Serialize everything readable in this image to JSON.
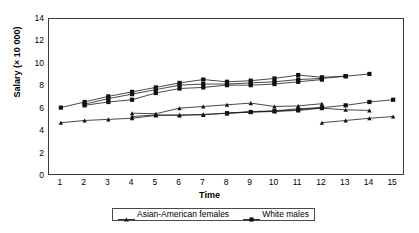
{
  "chart_data": {
    "type": "line",
    "title": "",
    "xlabel": "Time",
    "ylabel": "Salary (× 10 000)",
    "xlim": [
      0.5,
      15.5
    ],
    "ylim": [
      0,
      14
    ],
    "yticks": [
      0,
      2,
      4,
      6,
      8,
      10,
      12,
      14
    ],
    "xticks": [
      1,
      2,
      3,
      4,
      5,
      6,
      7,
      8,
      9,
      10,
      11,
      12,
      13,
      14,
      15
    ],
    "grid": false,
    "legend_position": "below-axes",
    "legend": [
      {
        "label": "Asian-American females",
        "marker": "triangle"
      },
      {
        "label": "White males",
        "marker": "square"
      }
    ],
    "series": [
      {
        "name": "White males",
        "marker": "square",
        "group": "white-males",
        "x": [
          1,
          2,
          3,
          4,
          5,
          6,
          7,
          8,
          9,
          10,
          11,
          12,
          13,
          14
        ],
        "values": [
          6.1,
          6.6,
          7.1,
          7.5,
          7.9,
          8.3,
          8.6,
          8.4,
          8.5,
          8.7,
          9.0,
          8.8,
          8.9,
          9.1
        ]
      },
      {
        "name": "White males",
        "marker": "square",
        "group": "white-males",
        "x": [
          2,
          3,
          4,
          5,
          6,
          7,
          8,
          9,
          10,
          11,
          12,
          13
        ],
        "values": [
          6.4,
          6.9,
          7.3,
          7.7,
          8.1,
          8.2,
          8.2,
          8.3,
          8.4,
          8.6,
          8.7,
          8.9
        ]
      },
      {
        "name": "White males",
        "marker": "square",
        "group": "white-males",
        "x": [
          2,
          3,
          4,
          5,
          6,
          7,
          8,
          9,
          10,
          11,
          12
        ],
        "values": [
          6.3,
          6.6,
          6.8,
          7.4,
          7.8,
          7.9,
          8.1,
          8.1,
          8.2,
          8.4,
          8.6
        ]
      },
      {
        "name": "White males",
        "marker": "square",
        "group": "white-males",
        "x": [
          8,
          9,
          10,
          11,
          12,
          13,
          14,
          15
        ],
        "values": [
          5.6,
          5.7,
          5.8,
          5.9,
          6.1,
          6.3,
          6.6,
          6.8
        ]
      },
      {
        "name": "Asian-American females",
        "marker": "triangle",
        "group": "asian-american-females",
        "x": [
          1,
          2,
          3,
          4,
          5,
          6,
          7,
          8,
          9,
          10,
          11,
          12,
          13,
          14
        ],
        "values": [
          4.75,
          4.95,
          5.05,
          5.15,
          5.4,
          5.45,
          5.45,
          5.6,
          5.7,
          5.75,
          5.85,
          6.05,
          5.9,
          5.85
        ]
      },
      {
        "name": "Asian-American females",
        "marker": "triangle",
        "group": "asian-american-females",
        "x": [
          4,
          5,
          6,
          7,
          8,
          9,
          10,
          11,
          12
        ],
        "values": [
          5.6,
          5.55,
          6.05,
          6.2,
          6.35,
          6.5,
          6.2,
          6.25,
          6.45
        ]
      },
      {
        "name": "Asian-American females",
        "marker": "triangle",
        "group": "asian-american-females",
        "x": [
          4,
          5,
          6,
          7,
          8,
          9,
          10,
          11,
          12
        ],
        "values": [
          5.3,
          5.45,
          5.4,
          5.5,
          5.6,
          5.75,
          5.8,
          6.0,
          6.1
        ]
      },
      {
        "name": "Asian-American females",
        "marker": "triangle",
        "group": "asian-american-females",
        "x": [
          12,
          13,
          14,
          15
        ],
        "values": [
          4.75,
          4.95,
          5.15,
          5.3
        ]
      }
    ],
    "colors": {
      "line": "#1a1a1a",
      "marker": "#111111",
      "axis": "#3a3a3a",
      "background": "#ffffff"
    }
  }
}
